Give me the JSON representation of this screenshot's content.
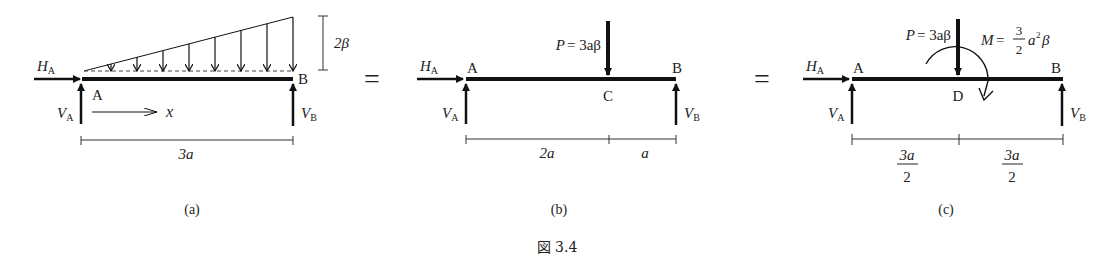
{
  "figure": {
    "caption": "図 3.4",
    "equals_sign": "="
  },
  "panels": [
    {
      "id": "a",
      "label": "(a)",
      "forces": {
        "horizontal_reaction": {
          "name": "H",
          "sub": "A"
        },
        "left_reaction": {
          "name": "V",
          "sub": "A"
        },
        "right_reaction": {
          "name": "V",
          "sub": "B"
        }
      },
      "points": {
        "left": "A",
        "right": "B"
      },
      "axis_label": "x",
      "distributed_load_max": "2β",
      "dimensions": [
        "3a"
      ]
    },
    {
      "id": "b",
      "label": "(b)",
      "forces": {
        "horizontal_reaction": {
          "name": "H",
          "sub": "A"
        },
        "left_reaction": {
          "name": "V",
          "sub": "A"
        },
        "right_reaction": {
          "name": "V",
          "sub": "B"
        }
      },
      "points": {
        "left": "A",
        "right": "B",
        "load_point": "C"
      },
      "point_load": {
        "symbol": "P",
        "value": "= 3aβ"
      },
      "dimensions": [
        "2a",
        "a"
      ]
    },
    {
      "id": "c",
      "label": "(c)",
      "forces": {
        "horizontal_reaction": {
          "name": "H",
          "sub": "A"
        },
        "left_reaction": {
          "name": "V",
          "sub": "A"
        },
        "right_reaction": {
          "name": "V",
          "sub": "B"
        }
      },
      "points": {
        "left": "A",
        "right": "B",
        "load_point": "D"
      },
      "point_load": {
        "symbol": "P",
        "value": "= 3aβ"
      },
      "moment": {
        "symbol": "M",
        "eq": "=",
        "num": "3",
        "den": "2",
        "tail": "a",
        "exp": "2",
        "end": "β"
      },
      "dimensions": [
        {
          "num": "3a",
          "den": "2"
        },
        {
          "num": "3a",
          "den": "2"
        }
      ]
    }
  ]
}
